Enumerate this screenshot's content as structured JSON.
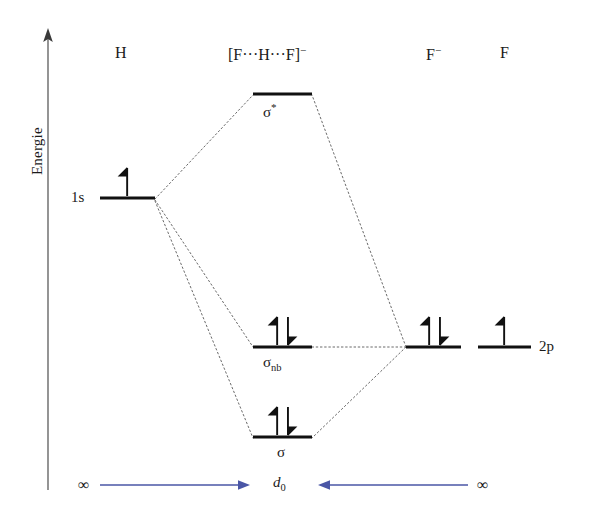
{
  "figure": {
    "axis": {
      "caption": "Energie",
      "arrow_direction": "up"
    },
    "species_headers": [
      {
        "id": "h",
        "label": "H",
        "x": 122
      },
      {
        "id": "fhf",
        "label": "[F···H···F]",
        "charge": "−",
        "x": 282
      },
      {
        "id": "f_anion",
        "label": "F",
        "charge": "−",
        "x": 433
      },
      {
        "id": "f_atom",
        "label": "F",
        "charge": "",
        "x": 505
      }
    ],
    "levels": [
      {
        "id": "sigma-star",
        "column": "fhf",
        "label": "σ",
        "label_sup": "*",
        "label_sub": "",
        "x1": 253,
        "x2": 312,
        "y": 94,
        "electrons": "none"
      },
      {
        "id": "h-1s",
        "column": "h",
        "label": "1s",
        "label_sup": "",
        "label_sub": "",
        "x1": 100,
        "x2": 155,
        "y": 198,
        "electrons": "single-up"
      },
      {
        "id": "sigma-nb",
        "column": "fhf",
        "label": "σ",
        "label_sup": "",
        "label_sub": "nb",
        "x1": 253,
        "x2": 312,
        "y": 347,
        "electrons": "pair"
      },
      {
        "id": "f-anion-2p",
        "column": "f_anion",
        "label": "",
        "label_sup": "",
        "label_sub": "",
        "x1": 406,
        "x2": 461,
        "y": 347,
        "electrons": "pair"
      },
      {
        "id": "f-atom-2p",
        "column": "f_atom",
        "label": "2p",
        "label_sup": "",
        "label_sub": "",
        "x1": 478,
        "x2": 531,
        "y": 347,
        "electrons": "single-up"
      },
      {
        "id": "sigma",
        "column": "fhf",
        "label": "σ",
        "label_sup": "",
        "label_sub": "",
        "x1": 253,
        "x2": 312,
        "y": 437,
        "electrons": "pair"
      }
    ],
    "level_side_labels": [
      {
        "id": "label-1s",
        "text": "1s",
        "x": 78,
        "y": 198
      },
      {
        "id": "label-2p",
        "text": "2p",
        "x": 540,
        "y": 347
      }
    ],
    "orbital_captions": [
      {
        "id": "cap-sigma-star",
        "base": "σ",
        "sup": "*",
        "sub": "",
        "x": 282,
        "y": 116
      },
      {
        "id": "cap-sigma-nb",
        "base": "σ",
        "sup": "",
        "sub": "nb",
        "x": 282,
        "y": 369
      },
      {
        "id": "cap-sigma",
        "base": "σ",
        "sup": "",
        "sub": "",
        "x": 282,
        "y": 459
      }
    ],
    "distance_axis": {
      "center_label": "d",
      "center_sub": "0",
      "left_label": "∞",
      "right_label": "∞",
      "arrow_color": "#4a56a6",
      "y": 485,
      "left_arrow": {
        "x1": 100,
        "x2": 248
      },
      "right_arrow": {
        "x1": 468,
        "x2": 320
      }
    },
    "colors": {
      "line": "#1a1a1a",
      "correlation": "#555555",
      "arrow_blue": "#4a56a6",
      "axis": "#6b6b6b",
      "background": "#ffffff"
    }
  }
}
